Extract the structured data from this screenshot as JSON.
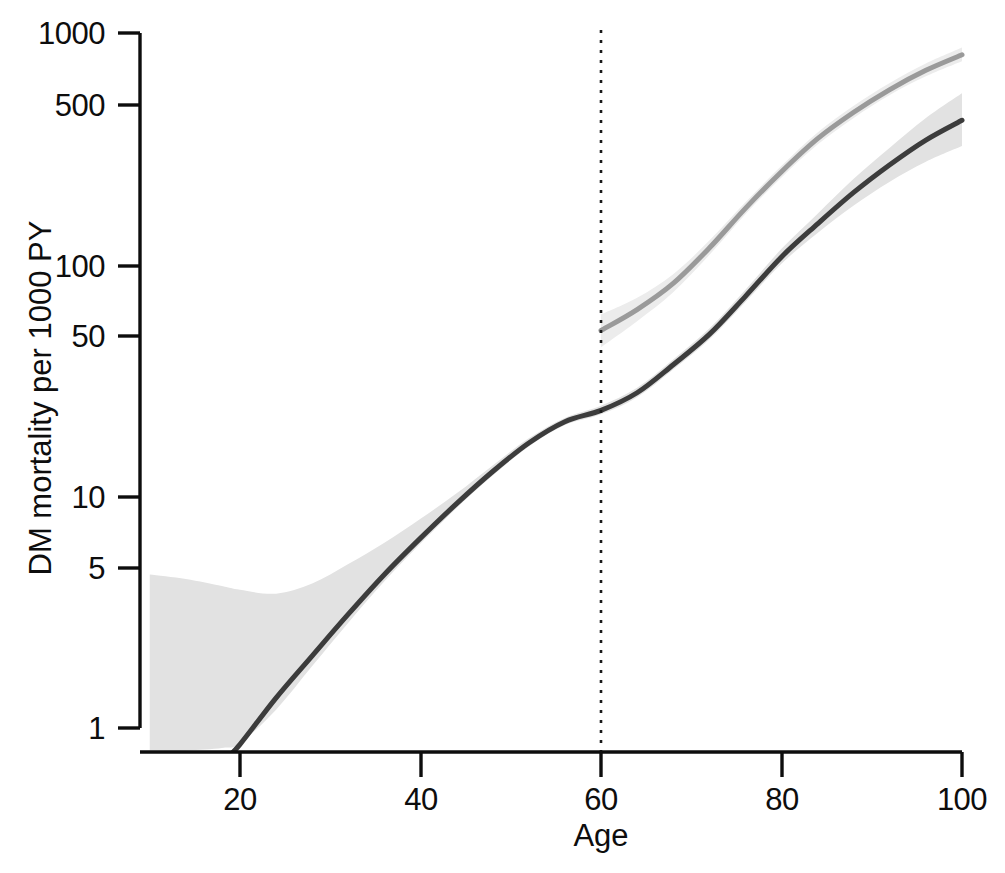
{
  "chart_data": {
    "type": "line",
    "title": "",
    "subtitle": "",
    "xlabel": "Age",
    "ylabel": "DM mortality per 1000 PY",
    "xlim": [
      9.8,
      100
    ],
    "ylim": [
      0.78,
      1300
    ],
    "yscale": "log",
    "xscale": "linear",
    "grid": false,
    "legend": "none",
    "xticks": [
      20,
      40,
      60,
      80,
      100
    ],
    "xticklabels": [
      "20",
      "40",
      "60",
      "80",
      "100"
    ],
    "yticks": [
      1,
      5,
      10,
      50,
      100,
      500,
      1000
    ],
    "yticklabels": [
      "1",
      "5",
      "10",
      "50",
      "100",
      "500",
      "1000"
    ],
    "annotations": [
      {
        "name": "age-60-reference-line",
        "type": "vline",
        "x": 60,
        "style": "dotted",
        "color": "#1a1a1a"
      }
    ],
    "series": [
      {
        "name": "dark-curve",
        "label": "",
        "color": "#3c3c3c",
        "linewidth": 5,
        "band_color": "#e2e2e2",
        "x": [
          10,
          14,
          18,
          20,
          24,
          28,
          32,
          36,
          40,
          44,
          48,
          52,
          56,
          60,
          64,
          68,
          72,
          76,
          80,
          84,
          88,
          92,
          96,
          100
        ],
        "y": [
          0.3,
          0.45,
          0.7,
          0.85,
          1.35,
          2.05,
          3.1,
          4.6,
          6.6,
          9.3,
          12.8,
          17.0,
          21.0,
          23.5,
          28.0,
          37.0,
          50.0,
          73.0,
          108.0,
          150.0,
          205.0,
          270.0,
          345.0,
          420.0
        ],
        "y_lower": [
          0.8,
          0.8,
          0.82,
          0.86,
          1.2,
          1.85,
          2.85,
          4.3,
          6.25,
          8.9,
          12.3,
          16.4,
          20.3,
          22.6,
          26.8,
          35.3,
          47.5,
          69.0,
          101.0,
          137.0,
          180.0,
          228.0,
          278.0,
          325.0
        ],
        "y_upper": [
          4.6,
          4.4,
          4.1,
          3.95,
          3.8,
          4.2,
          5.1,
          6.3,
          8.0,
          10.3,
          13.6,
          17.8,
          21.8,
          24.6,
          29.4,
          39.0,
          53.0,
          78.0,
          117.0,
          166.0,
          235.0,
          320.0,
          430.0,
          550.0
        ]
      },
      {
        "name": "gray-curve",
        "label": "",
        "color": "#9a9a9a",
        "linewidth": 5,
        "band_color": "#ececec",
        "x": [
          60,
          64,
          68,
          72,
          76,
          80,
          84,
          88,
          92,
          96,
          100
        ],
        "y": [
          52.0,
          64.0,
          83.0,
          118.0,
          175.0,
          252.0,
          350.0,
          455.0,
          570.0,
          690.0,
          805.0
        ],
        "y_lower": [
          44.0,
          57.0,
          76.0,
          110.0,
          165.0,
          238.0,
          330.0,
          430.0,
          540.0,
          650.0,
          755.0
        ],
        "y_upper": [
          61.0,
          72.0,
          91.0,
          127.0,
          186.0,
          267.0,
          372.0,
          485.0,
          608.0,
          738.0,
          865.0
        ]
      }
    ]
  },
  "axes": {
    "x_title": "Age",
    "y_title": "DM mortality per 1000 PY",
    "x_tick_labels": [
      "20",
      "40",
      "60",
      "80",
      "100"
    ],
    "y_tick_labels": [
      "1000",
      "500",
      "100",
      "50",
      "10",
      "5",
      "1"
    ]
  },
  "colors": {
    "dark_line": "#3c3c3c",
    "gray_line": "#9a9a9a",
    "dark_band": "#e2e2e2",
    "gray_band": "#ececec",
    "axis": "#0d0d0d",
    "background": "#ffffff"
  }
}
